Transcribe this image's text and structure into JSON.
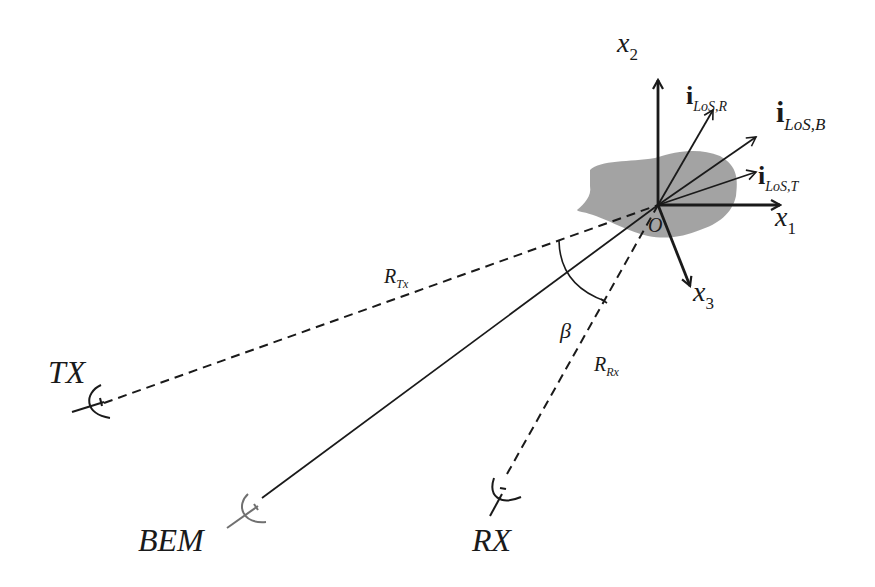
{
  "diagram": {
    "type": "bistatic-scattering-geometry",
    "origin_label": "O",
    "axes": [
      {
        "id": "x1",
        "label": "x",
        "sub": "1"
      },
      {
        "id": "x2",
        "label": "x",
        "sub": "2"
      },
      {
        "id": "x3",
        "label": "x",
        "sub": "3"
      }
    ],
    "unit_vectors": [
      {
        "id": "iLoS_R",
        "label": "i",
        "sub": "LoS",
        "sub2": ",R"
      },
      {
        "id": "iLoS_B",
        "label": "i",
        "sub": "LoS",
        "sub2": ",B"
      },
      {
        "id": "iLoS_T",
        "label": "i",
        "sub": "LoS",
        "sub2": ",T"
      }
    ],
    "ranges": [
      {
        "id": "R_Tx",
        "label": "R",
        "sub": "Tx"
      },
      {
        "id": "R_Rx",
        "label": "R",
        "sub": "Rx"
      }
    ],
    "angle": {
      "label": "β"
    },
    "stations": [
      {
        "id": "TX",
        "label": "TX"
      },
      {
        "id": "BEM",
        "label": "BEM"
      },
      {
        "id": "RX",
        "label": "RX"
      }
    ],
    "colors": {
      "line": "#1a1a1a",
      "target_fill": "#9e9e9e",
      "bem_antenna": "#707070"
    }
  }
}
